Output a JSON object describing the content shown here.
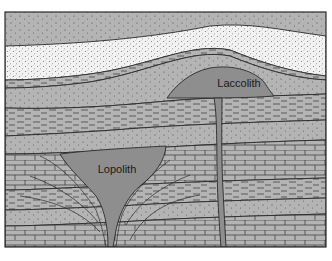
{
  "diagram": {
    "type": "geologic cross-section",
    "labels": {
      "laccolith": "Laccolith",
      "lopolith": "Lopolith"
    },
    "colors": {
      "background": "#ffffff",
      "rock_gray": "#b4b4b4",
      "sandstone_light": "#f2f2f2",
      "intrusion": "#8e8e8e",
      "line": "#2a2a2a"
    },
    "layers_top_to_bottom": [
      "stippled gray sandstone",
      "light speckled sandstone",
      "thin shale bands",
      "stippled gray sandstone",
      "dashed shale",
      "stippled gray sandstone",
      "brick limestone",
      "dashed shale",
      "stippled gray sandstone",
      "dashed shale",
      "brick limestone"
    ]
  }
}
